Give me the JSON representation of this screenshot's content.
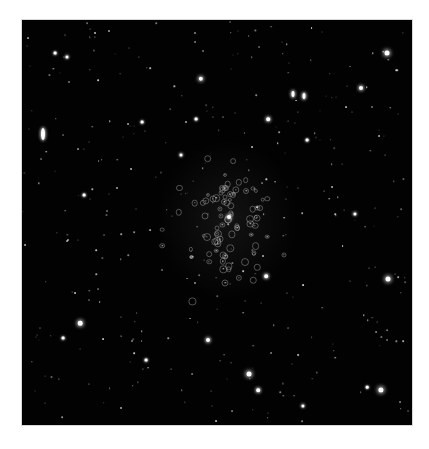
{
  "image": {
    "description": "Astronomical star field with a dense globular-like cluster near the center",
    "frame": {
      "x": 22,
      "y": 20,
      "width": 390,
      "height": 405
    },
    "colors": {
      "background": "#020202",
      "page": "#ffffff",
      "star": "#ffffff",
      "cluster_ring": "#aaaaaa"
    }
  },
  "features": {
    "streaks": [
      {
        "x": 21,
        "y": 114,
        "w": 4,
        "h": 12
      },
      {
        "x": 271,
        "y": 74,
        "w": 3,
        "h": 6
      },
      {
        "x": 282,
        "y": 76,
        "w": 3,
        "h": 6
      }
    ],
    "bright_stars": [
      {
        "x": 365,
        "y": 33,
        "r": 2.5
      },
      {
        "x": 179,
        "y": 59,
        "r": 2.2
      },
      {
        "x": 339,
        "y": 68,
        "r": 2
      },
      {
        "x": 246,
        "y": 99,
        "r": 1.8
      },
      {
        "x": 366,
        "y": 259,
        "r": 2.5
      },
      {
        "x": 58,
        "y": 303,
        "r": 2.3
      },
      {
        "x": 227,
        "y": 354,
        "r": 2.5
      },
      {
        "x": 359,
        "y": 370,
        "r": 2.6
      },
      {
        "x": 186,
        "y": 320,
        "r": 2
      },
      {
        "x": 236,
        "y": 370,
        "r": 1.8
      },
      {
        "x": 281,
        "y": 386,
        "r": 1.6
      },
      {
        "x": 207,
        "y": 197,
        "r": 2
      },
      {
        "x": 333,
        "y": 194,
        "r": 1.6
      },
      {
        "x": 244,
        "y": 256,
        "r": 1.8
      },
      {
        "x": 45,
        "y": 37,
        "r": 1.5
      },
      {
        "x": 33,
        "y": 33,
        "r": 1.4
      },
      {
        "x": 159,
        "y": 135,
        "r": 1.5
      },
      {
        "x": 120,
        "y": 102,
        "r": 1.4
      },
      {
        "x": 174,
        "y": 99,
        "r": 1.4
      },
      {
        "x": 62,
        "y": 175,
        "r": 1.4
      },
      {
        "x": 124,
        "y": 340,
        "r": 1.4
      },
      {
        "x": 285,
        "y": 120,
        "r": 1.4
      },
      {
        "x": 41,
        "y": 318,
        "r": 1.4
      },
      {
        "x": 345,
        "y": 367,
        "r": 1.3
      }
    ],
    "cluster_center": {
      "x": 205,
      "y": 200
    },
    "faint_star_count": 320,
    "cluster_ring_count": 90
  }
}
